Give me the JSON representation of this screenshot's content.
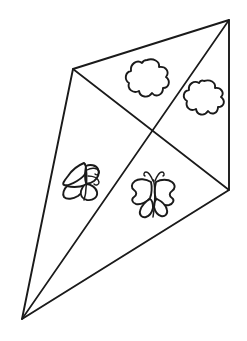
{
  "page": {
    "width": 247,
    "height": 341,
    "background_color": "#ffffff",
    "line_color": "#1a1a1a",
    "style": "black-and-white line art / coloring page"
  },
  "artwork": {
    "subject": "kite",
    "description": "Diamond kite drawn in perspective, split into four triangular panels by two crossing spars, decorated with two flowers and two butterflies.",
    "outline": {
      "name": "kite-outline",
      "vertices": [
        {
          "label": "top",
          "x": 229,
          "y": 20
        },
        {
          "label": "left",
          "x": 73,
          "y": 69
        },
        {
          "label": "bottom",
          "x": 22,
          "y": 319
        },
        {
          "label": "right",
          "x": 229,
          "y": 190
        }
      ],
      "path": "M229,20 L73,69 L22,319 L229,190 Z"
    },
    "spars": [
      {
        "name": "spar-left-to-right",
        "from": {
          "x": 73,
          "y": 69
        },
        "to": {
          "x": 229,
          "y": 190
        },
        "path": "M73,69 L229,190"
      },
      {
        "name": "spar-top-to-bottom",
        "from": {
          "x": 229,
          "y": 20
        },
        "to": {
          "x": 22,
          "y": 319
        },
        "path": "M229,20 L22,319"
      }
    ],
    "spar_intersection": {
      "x": 152,
      "y": 128
    },
    "panels": [
      {
        "name": "panel-top",
        "motif": "flower"
      },
      {
        "name": "panel-right",
        "motif": "flower"
      },
      {
        "name": "panel-left",
        "motif": "butterfly-side"
      },
      {
        "name": "panel-bottom",
        "motif": "butterfly-front"
      }
    ],
    "motifs": [
      {
        "name": "flower-top",
        "type": "flower",
        "lobes": 6,
        "center": {
          "x": 147,
          "y": 78
        },
        "radius": 19
      },
      {
        "name": "flower-right",
        "type": "flower",
        "lobes": 6,
        "center": {
          "x": 204,
          "y": 98
        },
        "radius": 18
      },
      {
        "name": "butterfly-left",
        "type": "butterfly",
        "orientation": "three-quarter, antennae to the right",
        "center": {
          "x": 80,
          "y": 180
        },
        "antennae": 2
      },
      {
        "name": "butterfly-right",
        "type": "butterfly",
        "orientation": "front-facing, symmetric wings",
        "center": {
          "x": 153,
          "y": 195
        },
        "antennae": 2
      }
    ]
  }
}
